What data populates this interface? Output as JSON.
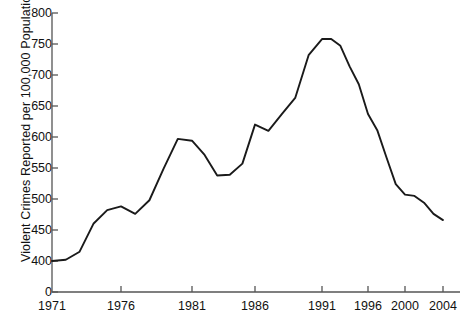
{
  "chart_data": {
    "type": "line",
    "title": "",
    "subtitle": "",
    "xlabel": "",
    "ylabel": "Violent Crimes Reported per 100,000 Population",
    "x": [
      1971,
      1972,
      1973,
      1974,
      1975,
      1976,
      1977,
      1978,
      1979,
      1980,
      1981,
      1982,
      1983,
      1984,
      1985,
      1986,
      1987,
      1988,
      1989,
      1990,
      1991,
      1992,
      1993,
      1994,
      1995,
      1996,
      1997,
      1998,
      1999,
      2000,
      2001,
      2002,
      2003,
      2004
    ],
    "values": [
      400,
      402,
      415,
      460,
      482,
      488,
      476,
      498,
      549,
      597,
      594,
      571,
      538,
      539,
      557,
      620,
      610,
      637,
      663,
      732,
      758,
      758,
      747,
      714,
      685,
      637,
      611,
      567,
      524,
      507,
      505,
      494,
      476,
      466
    ],
    "series": [
      {
        "name": "Violent Crimes Reported per 100,000 Population",
        "values": [
          400,
          402,
          415,
          460,
          482,
          488,
          476,
          498,
          549,
          597,
          594,
          571,
          538,
          539,
          557,
          620,
          610,
          637,
          663,
          732,
          758,
          758,
          747,
          714,
          685,
          637,
          611,
          567,
          524,
          507,
          505,
          494,
          476,
          466
        ]
      }
    ],
    "ylim": [
      0,
      800
    ],
    "y_axis_break": true,
    "y_break_note": "axis jumps from 0 to 400",
    "yticks": [
      0,
      400,
      450,
      500,
      550,
      600,
      650,
      700,
      750,
      800
    ],
    "ytick_labels": [
      "0",
      "400",
      "450",
      "500",
      "550",
      "600",
      "650",
      "700",
      "750",
      "800"
    ],
    "xticks": [
      1971,
      1976,
      1981,
      1986,
      1991,
      1996,
      2000,
      2004
    ],
    "xtick_labels": [
      "1971",
      "1976",
      "1981",
      "1986",
      "1991",
      "1996",
      "2000",
      "2004"
    ],
    "grid": false,
    "legend": false,
    "legend_position": "none",
    "line_color": "#1a1a1a",
    "axis_color": "#555555",
    "background_color": "#ffffff"
  },
  "axes": {
    "y_title": "Violent Crimes Reported per 100,000 Population"
  }
}
